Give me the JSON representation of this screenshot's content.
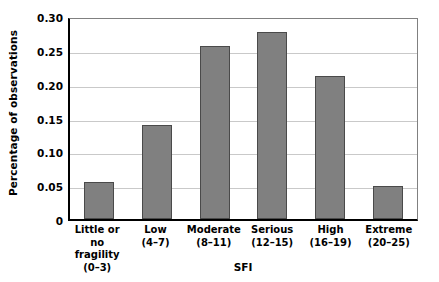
{
  "chart_data": {
    "type": "bar",
    "title": "",
    "xlabel": "SFI",
    "ylabel": "Percentage of observations",
    "categories": [
      "Little or no fragility",
      "Low",
      "Moderate",
      "Serious",
      "High",
      "Extreme"
    ],
    "category_lines": [
      {
        "line1": "Little or no",
        "line2": "fragility",
        "line3": "(0–3)"
      },
      {
        "line1": "Low",
        "line2": "(4–7)",
        "line3": ""
      },
      {
        "line1": "Moderate",
        "line2": "(8–11)",
        "line3": ""
      },
      {
        "line1": "Serious",
        "line2": "(12–15)",
        "line3": ""
      },
      {
        "line1": "High",
        "line2": "(16–19)",
        "line3": ""
      },
      {
        "line1": "Extreme",
        "line2": "(20–25)",
        "line3": ""
      }
    ],
    "values": [
      0.054,
      0.139,
      0.255,
      0.277,
      0.211,
      0.049
    ],
    "ylim": [
      0,
      0.3
    ],
    "yticks": [
      0,
      0.05,
      0.1,
      0.15,
      0.2,
      0.25,
      0.3
    ],
    "ytick_labels": [
      "0",
      "0.05",
      "0.10",
      "0.15",
      "0.20",
      "0.25",
      "0.30"
    ],
    "grid": true,
    "legend": false,
    "bar_color": "#808080",
    "bar_edge_color": "#4a4a4a",
    "grid_color": "#c9c9c9",
    "axis_color": "#000000"
  }
}
